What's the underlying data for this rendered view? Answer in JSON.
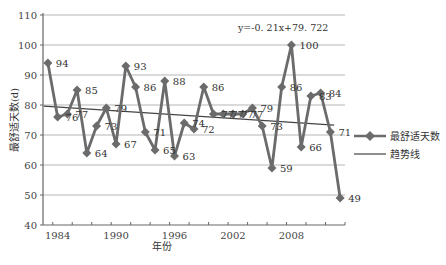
{
  "chart_data": {
    "type": "line",
    "title": "",
    "xlabel": "年份",
    "ylabel": "最舒适天数(d)",
    "ylim": [
      40,
      110
    ],
    "yticks": [
      40,
      50,
      60,
      70,
      80,
      90,
      100,
      110
    ],
    "xticks": [
      1984,
      1990,
      1996,
      2002,
      2008
    ],
    "xlim": [
      1982.5,
      2013.5
    ],
    "grid": true,
    "legend_position": "right",
    "x": [
      1983,
      1984,
      1985,
      1986,
      1987,
      1988,
      1989,
      1990,
      1991,
      1992,
      1993,
      1994,
      1995,
      1996,
      1997,
      1998,
      1999,
      2000,
      2001,
      2002,
      2003,
      2004,
      2005,
      2006,
      2007,
      2008,
      2009,
      2010,
      2011,
      2012,
      2013
    ],
    "series": [
      {
        "name": "最舒适天数",
        "marker": "diamond",
        "color": "#6b6b6b",
        "values": [
          94,
          76,
          77,
          85,
          64,
          73,
          79,
          67,
          93,
          86,
          71,
          65,
          88,
          63,
          74,
          72,
          86,
          77,
          77,
          77,
          77,
          79,
          73,
          59,
          86,
          100,
          66,
          83,
          84,
          71,
          49
        ]
      },
      {
        "name": "趋势线",
        "type": "trendline",
        "color": "#444444",
        "equation": "y=-0.21x+79.722",
        "slope": -0.21,
        "intercept": 79.722
      }
    ],
    "annotations": [
      "y=-0. 21x+79. 722"
    ]
  },
  "legend": {
    "items": [
      "最舒适天数",
      "趋势线"
    ]
  }
}
